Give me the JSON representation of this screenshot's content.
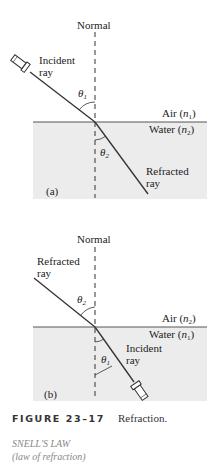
{
  "panel_a": {
    "normal_label": "Normal",
    "incident_label_1": "Incident",
    "incident_label_2": "ray",
    "theta1": "θ",
    "theta1_sub": "1",
    "air_label": "Air (",
    "air_n": "n",
    "air_sub": "1",
    "water_label": "Water (",
    "water_n": "n",
    "water_sub": "2",
    "theta2": "θ",
    "theta2_sub": "2",
    "refracted_label_1": "Refracted",
    "refracted_label_2": "ray",
    "panel_letter": "(a)"
  },
  "panel_b": {
    "normal_label": "Normal",
    "refracted_label_1": "Refracted",
    "refracted_label_2": "ray",
    "theta2": "θ",
    "theta2_sub": "2",
    "air_label": "Air (",
    "air_n": "n",
    "air_sub": "2",
    "water_label": "Water (",
    "water_n": "n",
    "water_sub": "1",
    "theta1": "θ",
    "theta1_sub": "1",
    "incident_label_1": "Incident",
    "incident_label_2": "ray",
    "panel_letter": "(b)"
  },
  "caption": {
    "figure_number": "FIGURE 23–17",
    "title": "Refraction."
  },
  "margin_note": {
    "line1": "SNELL'S LAW",
    "line2": "(law of refraction)"
  },
  "colors": {
    "water": "#ececec",
    "line": "#333333",
    "text": "#222222",
    "margin_text": "#888888"
  }
}
